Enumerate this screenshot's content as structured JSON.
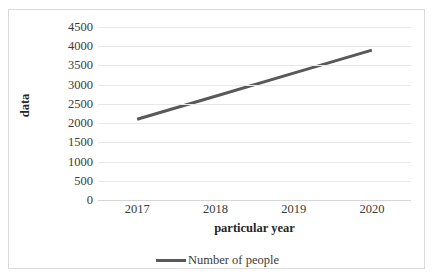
{
  "chart_data": {
    "type": "line",
    "title": "",
    "xlabel": "particular year",
    "ylabel": "data",
    "categories": [
      "2017",
      "2018",
      "2019",
      "2020"
    ],
    "x": [
      2017,
      2018,
      2019,
      2020
    ],
    "series": [
      {
        "name": "Number of people",
        "color": "#595959",
        "values": [
          2100,
          2700,
          3300,
          3900
        ]
      }
    ],
    "ylim": [
      0,
      4500
    ],
    "yticks": [
      0,
      500,
      1000,
      1500,
      2000,
      2500,
      3000,
      3500,
      4000,
      4500
    ],
    "ytick_labels": [
      "0",
      "500",
      "1000",
      "1500",
      "2000",
      "2500",
      "3000",
      "3500",
      "4000",
      "4500"
    ],
    "grid": true,
    "grid_axis": "y",
    "legend_position": "bottom",
    "legend": [
      {
        "label": "Number of people",
        "color": "#595959",
        "marker": "line"
      }
    ],
    "colors": {
      "series_line": "#595959",
      "gridline": "#e8e8e8",
      "frame_border": "#d9d9d9",
      "tick_text": "#3a3a3a",
      "axis_title_text": "#262626",
      "background": "#ffffff"
    }
  }
}
